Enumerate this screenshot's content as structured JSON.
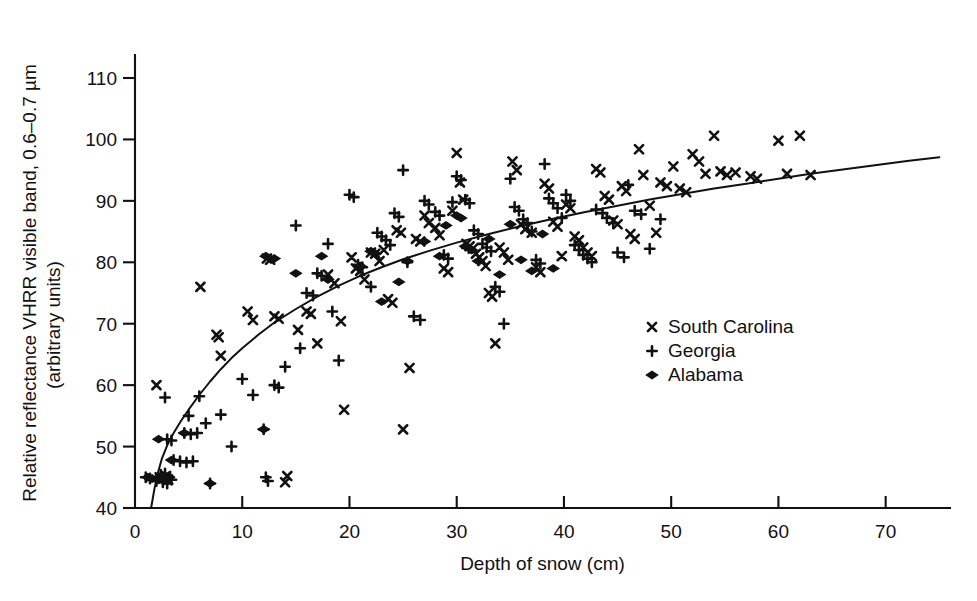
{
  "chart_data": {
    "type": "scatter",
    "title": "",
    "xlabel": "Depth of snow (cm)",
    "ylabel_line1": "Relative reflectance VHRR visible band, 0.6–0.7 µm",
    "ylabel_line2": "(arbitrary units)",
    "xlim": [
      0,
      76
    ],
    "ylim": [
      40,
      113
    ],
    "xticks": [
      0,
      10,
      20,
      30,
      40,
      50,
      60,
      70
    ],
    "yticks": [
      40,
      50,
      60,
      70,
      80,
      90,
      100,
      110
    ],
    "xtick_labels": [
      "0",
      "10",
      "20",
      "30",
      "40",
      "50",
      "60",
      "70"
    ],
    "ytick_labels": [
      "40",
      "50",
      "60",
      "70",
      "80",
      "90",
      "100",
      "110"
    ],
    "grid": false,
    "legend_position": "center-right",
    "marker_color": "#111111",
    "series": [
      {
        "name": "South Carolina",
        "marker": "x",
        "points": [
          [
            2.0,
            60.0
          ],
          [
            2.3,
            45.0
          ],
          [
            2.6,
            44.8
          ],
          [
            2.9,
            45.2
          ],
          [
            3.1,
            44.6
          ],
          [
            6.1,
            76.0
          ],
          [
            7.6,
            68.2
          ],
          [
            7.8,
            67.8
          ],
          [
            8.0,
            64.8
          ],
          [
            10.5,
            72.0
          ],
          [
            11.0,
            70.6
          ],
          [
            12.3,
            80.6
          ],
          [
            12.6,
            80.4
          ],
          [
            13.0,
            71.2
          ],
          [
            13.4,
            70.8
          ],
          [
            14.0,
            44.2
          ],
          [
            14.2,
            45.2
          ],
          [
            15.2,
            69.0
          ],
          [
            16.0,
            72.0
          ],
          [
            16.4,
            71.6
          ],
          [
            17.0,
            66.8
          ],
          [
            18.0,
            78.0
          ],
          [
            18.6,
            76.6
          ],
          [
            19.2,
            70.4
          ],
          [
            19.5,
            56.0
          ],
          [
            20.2,
            80.8
          ],
          [
            20.6,
            79.0
          ],
          [
            21.0,
            78.6
          ],
          [
            21.4,
            77.2
          ],
          [
            22.0,
            81.6
          ],
          [
            22.4,
            81.4
          ],
          [
            22.8,
            80.2
          ],
          [
            23.2,
            82.0
          ],
          [
            23.6,
            74.0
          ],
          [
            24.0,
            73.4
          ],
          [
            24.4,
            85.2
          ],
          [
            24.8,
            84.8
          ],
          [
            25.0,
            52.8
          ],
          [
            25.6,
            62.8
          ],
          [
            26.2,
            83.8
          ],
          [
            26.6,
            83.4
          ],
          [
            27.0,
            87.6
          ],
          [
            27.4,
            86.4
          ],
          [
            28.0,
            85.6
          ],
          [
            28.4,
            84.4
          ],
          [
            28.8,
            79.0
          ],
          [
            29.2,
            78.4
          ],
          [
            29.6,
            88.4
          ],
          [
            30.0,
            97.8
          ],
          [
            30.3,
            93.0
          ],
          [
            30.6,
            90.2
          ],
          [
            30.9,
            83.0
          ],
          [
            31.2,
            82.6
          ],
          [
            31.5,
            82.2
          ],
          [
            31.8,
            81.4
          ],
          [
            32.1,
            80.8
          ],
          [
            32.4,
            80.2
          ],
          [
            32.7,
            79.4
          ],
          [
            33.0,
            75.0
          ],
          [
            33.3,
            74.4
          ],
          [
            33.6,
            66.8
          ],
          [
            34.0,
            82.4
          ],
          [
            34.4,
            81.6
          ],
          [
            34.8,
            80.4
          ],
          [
            35.2,
            96.4
          ],
          [
            35.6,
            95.0
          ],
          [
            36.0,
            86.2
          ],
          [
            36.4,
            85.4
          ],
          [
            37.0,
            84.8
          ],
          [
            37.4,
            79.2
          ],
          [
            37.8,
            78.4
          ],
          [
            38.2,
            92.8
          ],
          [
            38.6,
            92.0
          ],
          [
            39.0,
            86.6
          ],
          [
            39.4,
            85.8
          ],
          [
            39.8,
            81.0
          ],
          [
            40.2,
            89.4
          ],
          [
            40.6,
            88.8
          ],
          [
            41.0,
            84.2
          ],
          [
            41.4,
            83.6
          ],
          [
            41.8,
            82.4
          ],
          [
            42.2,
            81.6
          ],
          [
            42.6,
            81.0
          ],
          [
            43.0,
            95.2
          ],
          [
            43.4,
            94.6
          ],
          [
            43.8,
            90.8
          ],
          [
            44.2,
            90.2
          ],
          [
            44.6,
            86.8
          ],
          [
            45.0,
            86.2
          ],
          [
            45.4,
            92.4
          ],
          [
            45.8,
            91.6
          ],
          [
            46.2,
            84.6
          ],
          [
            46.6,
            83.8
          ],
          [
            47.0,
            98.4
          ],
          [
            47.4,
            94.2
          ],
          [
            48.0,
            89.2
          ],
          [
            48.6,
            84.8
          ],
          [
            49.0,
            93.0
          ],
          [
            49.6,
            92.4
          ],
          [
            50.2,
            95.6
          ],
          [
            50.8,
            92.0
          ],
          [
            51.4,
            91.4
          ],
          [
            52.0,
            97.6
          ],
          [
            52.6,
            96.4
          ],
          [
            53.2,
            94.4
          ],
          [
            54.0,
            100.6
          ],
          [
            54.6,
            94.8
          ],
          [
            55.2,
            94.2
          ],
          [
            56.0,
            94.6
          ],
          [
            57.4,
            94.0
          ],
          [
            58.0,
            93.6
          ],
          [
            60.0,
            99.8
          ],
          [
            60.8,
            94.4
          ],
          [
            62.0,
            100.6
          ],
          [
            63.0,
            94.2
          ]
        ]
      },
      {
        "name": "Georgia",
        "marker": "+",
        "points": [
          [
            1.0,
            45.0
          ],
          [
            1.4,
            44.8
          ],
          [
            2.0,
            44.4
          ],
          [
            2.4,
            45.4
          ],
          [
            2.6,
            44.2
          ],
          [
            2.8,
            45.6
          ],
          [
            3.0,
            44.0
          ],
          [
            3.2,
            45.0
          ],
          [
            3.4,
            44.6
          ],
          [
            2.8,
            58.0
          ],
          [
            3.0,
            51.2
          ],
          [
            3.4,
            51.0
          ],
          [
            3.6,
            47.8
          ],
          [
            4.2,
            47.6
          ],
          [
            4.8,
            47.4
          ],
          [
            5.4,
            47.6
          ],
          [
            4.6,
            52.2
          ],
          [
            5.2,
            52.0
          ],
          [
            5.8,
            52.2
          ],
          [
            5.0,
            55.0
          ],
          [
            6.0,
            58.2
          ],
          [
            6.6,
            53.8
          ],
          [
            7.0,
            44.0
          ],
          [
            8.0,
            55.2
          ],
          [
            9.0,
            50.0
          ],
          [
            10.0,
            61.0
          ],
          [
            11.0,
            58.4
          ],
          [
            12.0,
            52.8
          ],
          [
            12.2,
            45.0
          ],
          [
            12.4,
            44.4
          ],
          [
            13.0,
            60.0
          ],
          [
            13.4,
            59.6
          ],
          [
            14.0,
            63.0
          ],
          [
            15.0,
            86.0
          ],
          [
            15.4,
            66.0
          ],
          [
            16.0,
            75.0
          ],
          [
            16.6,
            74.6
          ],
          [
            17.0,
            78.2
          ],
          [
            17.4,
            77.8
          ],
          [
            18.0,
            83.0
          ],
          [
            18.4,
            72.0
          ],
          [
            19.0,
            64.0
          ],
          [
            20.0,
            91.0
          ],
          [
            20.4,
            90.6
          ],
          [
            20.8,
            79.6
          ],
          [
            21.2,
            79.2
          ],
          [
            22.0,
            76.0
          ],
          [
            22.6,
            84.8
          ],
          [
            23.0,
            84.2
          ],
          [
            23.4,
            83.6
          ],
          [
            23.8,
            82.8
          ],
          [
            24.2,
            88.0
          ],
          [
            24.6,
            87.4
          ],
          [
            25.0,
            95.0
          ],
          [
            25.4,
            80.0
          ],
          [
            26.0,
            71.2
          ],
          [
            26.6,
            70.6
          ],
          [
            27.0,
            90.0
          ],
          [
            27.4,
            89.4
          ],
          [
            28.0,
            88.2
          ],
          [
            28.4,
            87.6
          ],
          [
            28.8,
            81.2
          ],
          [
            29.2,
            80.6
          ],
          [
            29.6,
            89.8
          ],
          [
            30.0,
            94.0
          ],
          [
            30.4,
            93.4
          ],
          [
            30.8,
            90.2
          ],
          [
            31.2,
            89.6
          ],
          [
            31.6,
            85.2
          ],
          [
            32.0,
            84.6
          ],
          [
            32.4,
            83.0
          ],
          [
            32.8,
            82.4
          ],
          [
            33.2,
            81.8
          ],
          [
            33.6,
            76.0
          ],
          [
            34.0,
            75.2
          ],
          [
            34.4,
            70.0
          ],
          [
            35.0,
            93.6
          ],
          [
            35.4,
            89.0
          ],
          [
            35.8,
            88.4
          ],
          [
            36.2,
            87.0
          ],
          [
            36.6,
            86.4
          ],
          [
            37.0,
            85.0
          ],
          [
            37.4,
            80.4
          ],
          [
            37.8,
            79.8
          ],
          [
            38.2,
            96.0
          ],
          [
            38.6,
            90.4
          ],
          [
            39.0,
            89.6
          ],
          [
            39.4,
            88.8
          ],
          [
            39.8,
            87.2
          ],
          [
            40.2,
            91.0
          ],
          [
            40.6,
            90.0
          ],
          [
            41.0,
            82.8
          ],
          [
            41.4,
            82.0
          ],
          [
            41.8,
            81.2
          ],
          [
            42.2,
            80.6
          ],
          [
            42.6,
            80.0
          ],
          [
            43.0,
            88.6
          ],
          [
            43.6,
            88.0
          ],
          [
            44.0,
            87.2
          ],
          [
            44.6,
            86.4
          ],
          [
            45.0,
            81.6
          ],
          [
            45.6,
            80.8
          ],
          [
            46.0,
            92.6
          ],
          [
            46.6,
            88.4
          ],
          [
            47.2,
            87.8
          ],
          [
            48.0,
            82.2
          ],
          [
            49.0,
            87.0
          ]
        ]
      },
      {
        "name": "Alabama",
        "marker": "diamond",
        "points": [
          [
            1.2,
            45.0
          ],
          [
            1.6,
            44.8
          ],
          [
            2.2,
            44.6
          ],
          [
            2.6,
            45.0
          ],
          [
            3.0,
            44.8
          ],
          [
            2.2,
            51.2
          ],
          [
            3.4,
            47.8
          ],
          [
            4.6,
            52.2
          ],
          [
            7.0,
            44.0
          ],
          [
            12.0,
            52.8
          ],
          [
            12.2,
            81.0
          ],
          [
            13.0,
            80.6
          ],
          [
            15.0,
            78.2
          ],
          [
            17.4,
            81.0
          ],
          [
            18.0,
            77.2
          ],
          [
            21.0,
            79.4
          ],
          [
            22.0,
            81.8
          ],
          [
            22.4,
            81.4
          ],
          [
            23.0,
            73.6
          ],
          [
            24.6,
            76.8
          ],
          [
            25.4,
            80.2
          ],
          [
            27.0,
            83.4
          ],
          [
            28.4,
            81.0
          ],
          [
            29.0,
            86.0
          ],
          [
            30.0,
            87.6
          ],
          [
            30.4,
            87.2
          ],
          [
            30.8,
            82.6
          ],
          [
            31.4,
            82.0
          ],
          [
            32.0,
            80.2
          ],
          [
            33.0,
            83.8
          ],
          [
            34.0,
            78.0
          ],
          [
            35.0,
            86.2
          ],
          [
            36.0,
            80.4
          ],
          [
            37.0,
            78.6
          ],
          [
            38.0,
            84.6
          ],
          [
            39.0,
            79.0
          ]
        ]
      }
    ]
  },
  "legend": {
    "items": [
      {
        "marker": "x",
        "label": "South Carolina"
      },
      {
        "marker": "+",
        "label": "Georgia"
      },
      {
        "marker": "diamond",
        "label": "Alabama"
      }
    ]
  },
  "fit_curve": {
    "description": "logarithmic best-fit line",
    "points": [
      [
        1.5,
        40.0
      ],
      [
        1.8,
        43.0
      ],
      [
        2.1,
        45.5
      ],
      [
        2.5,
        48.0
      ],
      [
        3.0,
        50.2
      ],
      [
        3.6,
        52.2
      ],
      [
        4.3,
        54.2
      ],
      [
        5.0,
        56.0
      ],
      [
        6.0,
        58.4
      ],
      [
        7.0,
        60.6
      ],
      [
        8.0,
        62.6
      ],
      [
        9.0,
        64.4
      ],
      [
        10.0,
        66.0
      ],
      [
        11.5,
        68.2
      ],
      [
        13.0,
        70.2
      ],
      [
        15.0,
        72.4
      ],
      [
        17.0,
        74.4
      ],
      [
        19.0,
        76.2
      ],
      [
        21.0,
        77.8
      ],
      [
        23.0,
        79.2
      ],
      [
        25.0,
        80.5
      ],
      [
        27.5,
        81.9
      ],
      [
        30.0,
        83.2
      ],
      [
        33.0,
        84.6
      ],
      [
        36.0,
        85.9
      ],
      [
        39.0,
        87.1
      ],
      [
        42.0,
        88.2
      ],
      [
        45.0,
        89.2
      ],
      [
        48.0,
        90.2
      ],
      [
        51.0,
        91.1
      ],
      [
        54.0,
        92.0
      ],
      [
        57.0,
        92.8
      ],
      [
        60.0,
        93.6
      ],
      [
        63.0,
        94.4
      ],
      [
        66.0,
        95.1
      ],
      [
        69.0,
        95.8
      ],
      [
        72.0,
        96.5
      ],
      [
        75.0,
        97.1
      ]
    ]
  }
}
